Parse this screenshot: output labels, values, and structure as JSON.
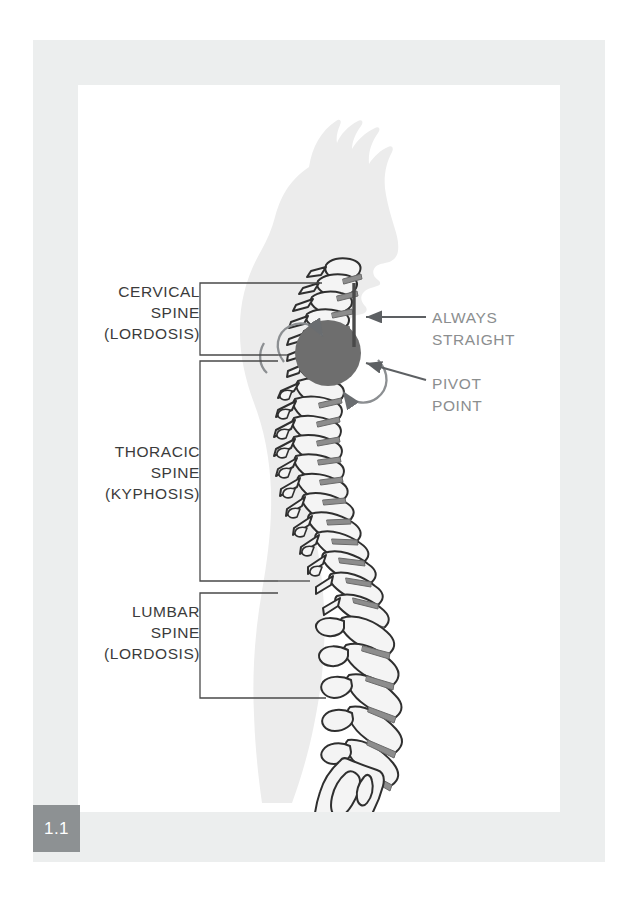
{
  "figure": {
    "number": "1.1",
    "badge_color": "#8d9193",
    "frame_color": "#eceeee",
    "canvas_color": "#ffffff"
  },
  "illustration": {
    "subject": "human-spine-lateral-view",
    "silhouette_color": "#ececec",
    "bone_fill": "#f4f4f4",
    "bone_outline": "#2f2f2f",
    "disc_color": "#8d8d8d",
    "pivot_circle_color": "#6e6e6e"
  },
  "left_labels": [
    {
      "id": "cervical",
      "text": "CERVICAL\nSPINE\n(LORDOSIS)",
      "color": "#3b3b3b"
    },
    {
      "id": "thoracic",
      "text": "THORACIC\nSPINE\n(KYPHOSIS)",
      "color": "#3b3b3b"
    },
    {
      "id": "lumbar",
      "text": "LUMBAR\nSPINE\n(LORDOSIS)",
      "color": "#3b3b3b"
    }
  ],
  "right_labels": [
    {
      "id": "always-straight",
      "text": "ALWAYS\nSTRAIGHT",
      "color": "#8b8e8f"
    },
    {
      "id": "pivot-point",
      "text": "PIVOT\nPOINT",
      "color": "#8b8e8f"
    }
  ],
  "annotations": {
    "straight_line": "vertical reference line alongside cervical spine",
    "rotation_arrows": "two curved arrows around the pivot point",
    "leader_line_color": "#5d6063",
    "bracket_color": "#4a4a4a"
  }
}
